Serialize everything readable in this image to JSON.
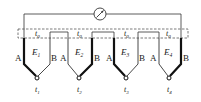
{
  "diagram": {
    "meter": {
      "icon": "galvanometer-icon"
    },
    "reference_label": "t",
    "reference_sub": "0",
    "thermocouples": [
      {
        "left": "A",
        "right": "B",
        "emf": "E",
        "emf_sub": "1",
        "junction": "t",
        "junction_sub": "1"
      },
      {
        "left": "A",
        "right": "B",
        "emf": "E",
        "emf_sub": "2",
        "junction": "t",
        "junction_sub": "2"
      },
      {
        "left": "A",
        "right": "B",
        "emf": "E",
        "emf_sub": "3",
        "junction": "t",
        "junction_sub": "3"
      },
      {
        "left": "A",
        "right": "B",
        "emf": "E",
        "emf_sub": "4",
        "junction": "t",
        "junction_sub": "4"
      }
    ]
  }
}
